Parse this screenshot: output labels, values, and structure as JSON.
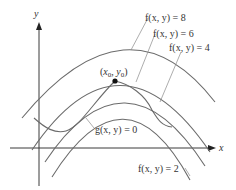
{
  "diagram": {
    "axes": {
      "x_label": "x",
      "y_label": "y"
    },
    "level_curves": [
      {
        "id": "f8",
        "label": "f(x, y) = 8"
      },
      {
        "id": "f6",
        "label": "f(x, y) = 6"
      },
      {
        "id": "f4",
        "label": "f(x, y) = 4"
      },
      {
        "id": "f2",
        "label": "f(x, y) = 2"
      }
    ],
    "constraint": {
      "label": "g(x, y) = 0"
    },
    "point": {
      "label": "(x0, y0)",
      "x_sub": "0",
      "y_sub": "0"
    }
  }
}
